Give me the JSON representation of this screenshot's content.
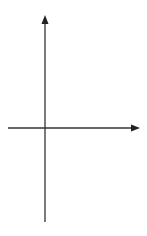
{
  "diagram": {
    "type": "coordinate-grid",
    "x_axis": {
      "label": "x",
      "min": -2,
      "max": 5,
      "tick_labels": [
        "-1",
        "1",
        "2",
        "3",
        "4"
      ]
    },
    "y_axis": {
      "label": "y",
      "min": -5,
      "max": 6,
      "tick_labels": [
        "5",
        "4",
        "3",
        "2",
        "1",
        "-1",
        "-2",
        "-3",
        "-4"
      ]
    },
    "origin_label": "0",
    "shape": {
      "kind": "triangle",
      "vertices": [
        [
          1,
          -2
        ],
        [
          3,
          -2
        ],
        [
          3,
          -1
        ]
      ],
      "fill": "#9a9a9a",
      "stroke": "#333333"
    },
    "colors": {
      "grid": "#e2e2e2",
      "axis": "#333333",
      "text": "#555555"
    }
  }
}
